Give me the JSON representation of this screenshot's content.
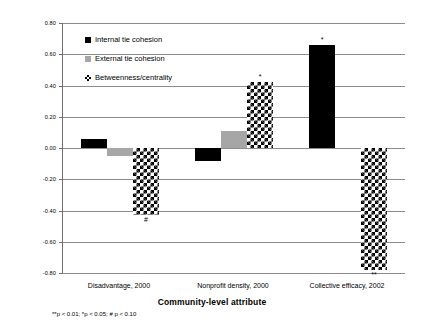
{
  "chart_data": {
    "type": "bar",
    "title": "",
    "xlabel": "Community-level attribute",
    "ylabel": "Standardized  coefficients",
    "categories": [
      "Disadvantage, 2000",
      "Nonprofit density, 2000",
      "Collective efficacy, 2002"
    ],
    "ylim": [
      -0.8,
      0.8
    ],
    "yticks": [
      "0.80",
      "0.60",
      "0.40",
      "0.20",
      "0.00",
      "-0.20",
      "-0.40",
      "-0.60",
      "-0.80"
    ],
    "ytick_values": [
      0.8,
      0.6,
      0.4,
      0.2,
      0.0,
      -0.2,
      -0.4,
      -0.6,
      -0.8
    ],
    "grid": true,
    "legend_position": "upper-left-inside",
    "series": [
      {
        "name": "Internal tie cohesion",
        "color": "#000000",
        "fill": "solid-black",
        "values": [
          0.06,
          -0.08,
          0.66
        ],
        "significance": [
          "",
          "",
          "*"
        ]
      },
      {
        "name": "External tie cohesion",
        "color": "#a6a6a6",
        "fill": "solid-gray",
        "values": [
          -0.05,
          0.11,
          0.0
        ],
        "significance": [
          "",
          "",
          ""
        ]
      },
      {
        "name": "Betweenness/centrality",
        "color": "#000000",
        "fill": "checkerboard",
        "values": [
          -0.43,
          0.42,
          -0.78
        ],
        "significance": [
          "#",
          "*",
          "**"
        ]
      }
    ],
    "footnote": "**p < 0.01; *p < 0.05; # p < 0.10"
  }
}
